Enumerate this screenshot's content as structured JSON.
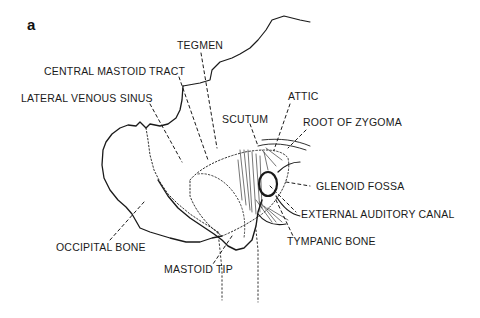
{
  "figure": {
    "panel_label": "a",
    "line_color": "#1a1a1a",
    "background": "#ffffff"
  },
  "labels": {
    "tegmen": "TEGMEN",
    "central_mastoid_tract": "CENTRAL MASTOID TRACT",
    "lateral_venous_sinus": "LATERAL VENOUS SINUS",
    "scutum": "SCUTUM",
    "attic": "ATTIC",
    "root_of_zygoma": "ROOT OF ZYGOMA",
    "glenoid_fossa": "GLENOID FOSSA",
    "external_auditory_canal": "EXTERNAL AUDITORY CANAL",
    "tympanic_bone": "TYMPANIC BONE",
    "occipital_bone": "OCCIPITAL BONE",
    "mastoid_tip": "MASTOID TIP"
  }
}
